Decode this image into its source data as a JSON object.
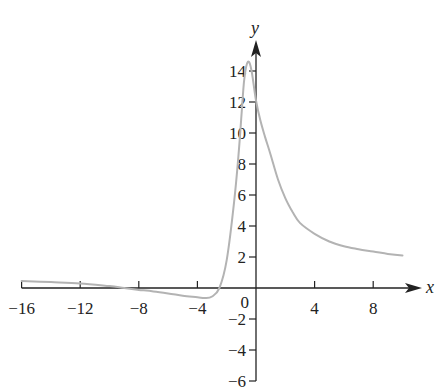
{
  "chart_data": {
    "type": "line",
    "title": "",
    "xlabel": "x",
    "ylabel": "y",
    "xlim": [
      -16,
      10
    ],
    "ylim": [
      -6,
      15
    ],
    "grid": false,
    "legend": null,
    "x_ticks": [
      -16,
      -12,
      -8,
      -4,
      0,
      4,
      8
    ],
    "x_tick_labels": [
      "−16",
      "−12",
      "−8",
      "−4",
      "0",
      "4",
      "8"
    ],
    "y_ticks": [
      -6,
      -4,
      -2,
      2,
      4,
      6,
      8,
      10,
      12,
      14
    ],
    "y_tick_labels": [
      "−6",
      "−4",
      "−2",
      "2",
      "4",
      "6",
      "8",
      "10",
      "12",
      "14"
    ],
    "series": [
      {
        "name": "curve",
        "color": "#b3b3b3",
        "x": [
          -16,
          -14,
          -12,
          -10,
          -9,
          -8,
          -7,
          -6,
          -5,
          -4,
          -3.5,
          -3,
          -2.5,
          -2,
          -1.5,
          -1.2,
          -1,
          -0.8,
          -0.55,
          -0.3,
          0,
          0.3,
          0.6,
          1,
          1.5,
          2,
          2.5,
          3,
          4,
          5,
          6,
          7,
          8,
          9,
          10
        ],
        "y": [
          0.45,
          0.38,
          0.3,
          0.12,
          0.0,
          -0.12,
          -0.22,
          -0.35,
          -0.5,
          -0.6,
          -0.65,
          -0.55,
          0.0,
          1.8,
          5.5,
          8.5,
          11.0,
          13.5,
          14.6,
          14.0,
          12.1,
          10.8,
          9.8,
          8.6,
          7.0,
          5.8,
          4.9,
          4.2,
          3.5,
          3.0,
          2.7,
          2.5,
          2.35,
          2.2,
          2.1
        ]
      }
    ]
  },
  "axes": {
    "x_label": "x",
    "y_label": "y",
    "origin_label": "0"
  },
  "colors": {
    "curve": "#b3b3b3",
    "axis": "#222222"
  }
}
